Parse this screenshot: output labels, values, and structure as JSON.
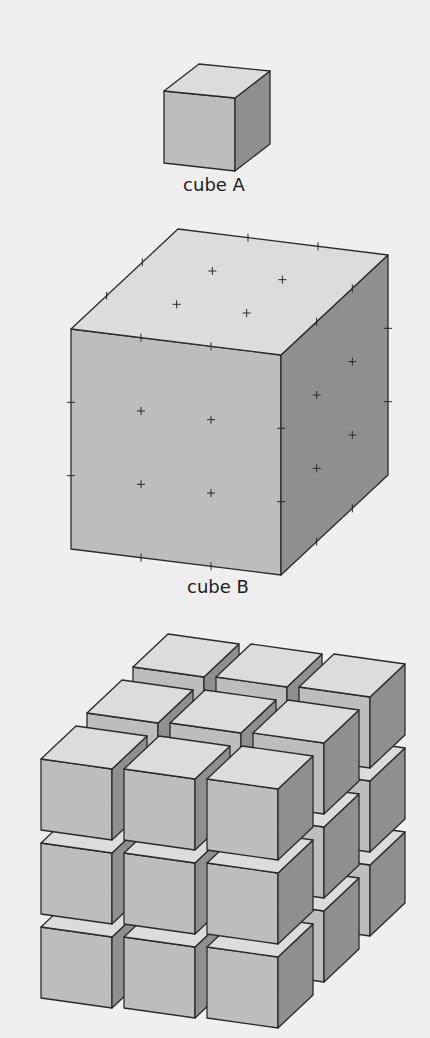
{
  "colors": {
    "background": "#efefef",
    "top_face": "#dcdcdc",
    "front_face": "#bdbdbd",
    "side_face": "#8f8f8f",
    "edge": "#2a2a2a"
  },
  "figures": {
    "cube_a": {
      "label": "cube A",
      "label_pos": [
        214,
        188
      ],
      "ftl": [
        164,
        91
      ],
      "ftr": [
        235,
        98
      ],
      "fbl": [
        164,
        163
      ],
      "fbr": [
        235,
        171
      ],
      "depth": [
        35,
        -27
      ]
    },
    "cube_b": {
      "label": "cube B",
      "label_pos": [
        218,
        590
      ],
      "ftl": [
        71,
        329
      ],
      "ftr": [
        281,
        355
      ],
      "fbl": [
        71,
        549
      ],
      "fbr": [
        281,
        575
      ],
      "depth": [
        107,
        -100
      ],
      "divisions": 3
    },
    "stacked": {
      "description": "3x3x3 arrangement of cube A",
      "origin_ftl": [
        41,
        759
      ],
      "cube_w": 71,
      "cube_h": 71,
      "slant": 10,
      "cube_depth": [
        35,
        -33
      ],
      "step_x": [
        83,
        10
      ],
      "step_y": [
        0,
        84
      ],
      "step_z": [
        46,
        -46
      ],
      "count": [
        3,
        3,
        3
      ]
    }
  }
}
